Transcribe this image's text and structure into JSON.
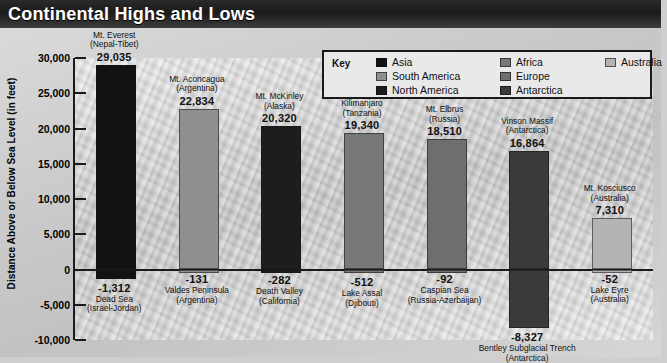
{
  "title": "Continental Highs and Lows",
  "axis": {
    "y_title": "Distance Above or Below Sea Level (in feet)",
    "ticks": [
      "30,000",
      "25,000",
      "20,000",
      "15,000",
      "10,000",
      "5,000",
      "0",
      "-5,000",
      "-10,000"
    ]
  },
  "key": {
    "label": "Key",
    "columns": [
      [
        {
          "name": "Asia",
          "color": "#121212"
        },
        {
          "name": "South America",
          "color": "#8f8f8f"
        },
        {
          "name": "North America",
          "color": "#1d1d1d"
        }
      ],
      [
        {
          "name": "Africa",
          "color": "#787878"
        },
        {
          "name": "Europe",
          "color": "#6e6e6e"
        },
        {
          "name": "Antarctica",
          "color": "#3a3a3a"
        }
      ],
      [
        {
          "name": "Australia",
          "color": "#b4b4b4"
        }
      ]
    ]
  },
  "chart_data": {
    "type": "bar",
    "title": "Continental Highs and Lows",
    "xlabel": "",
    "ylabel": "Distance Above or Below Sea Level (in feet)",
    "ylim": [
      -10000,
      30000
    ],
    "ytick_step": 5000,
    "grid": false,
    "legend_position": "top-right",
    "categories": [
      "Asia",
      "South America",
      "North America",
      "Africa",
      "Europe",
      "Antarctica",
      "Australia"
    ],
    "series": [
      {
        "name": "Highest point",
        "values": [
          29035,
          22834,
          20320,
          19340,
          18510,
          16864,
          7310
        ]
      },
      {
        "name": "Lowest point",
        "values": [
          -1312,
          -131,
          -282,
          -512,
          -92,
          -8327,
          -52
        ]
      }
    ],
    "points": [
      {
        "continent": "Asia",
        "color": "#121212",
        "high_name": "Mt. Everest",
        "high_place": "(Nepal-Tibet)",
        "high_value": 29035,
        "high_label": "29,035",
        "low_name": "Dead Sea",
        "low_place": "(Israel-Jordan)",
        "low_value": -1312,
        "low_label": "-1,312"
      },
      {
        "continent": "South America",
        "color": "#8f8f8f",
        "high_name": "Mt. Aconcagua",
        "high_place": "(Argentina)",
        "high_value": 22834,
        "high_label": "22,834",
        "low_name": "Valdes Peninsula",
        "low_place": "(Argentina)",
        "low_value": -131,
        "low_label": "-131"
      },
      {
        "continent": "North America",
        "color": "#1d1d1d",
        "high_name": "Mt. McKinley",
        "high_place": "(Alaska)",
        "high_value": 20320,
        "high_label": "20,320",
        "low_name": "Death Valley",
        "low_place": "(California)",
        "low_value": -282,
        "low_label": "-282"
      },
      {
        "continent": "Africa",
        "color": "#787878",
        "high_name": "Kilimanjaro",
        "high_place": "(Tanzania)",
        "high_value": 19340,
        "high_label": "19,340",
        "low_name": "Lake Assal",
        "low_place": "(Djibouti)",
        "low_value": -512,
        "low_label": "-512"
      },
      {
        "continent": "Europe",
        "color": "#6e6e6e",
        "high_name": "Mt. Elbrus",
        "high_place": "(Russia)",
        "high_value": 18510,
        "high_label": "18,510",
        "low_name": "Caspian Sea",
        "low_place": "(Russia-Azerbaijan)",
        "low_value": -92,
        "low_label": "-92"
      },
      {
        "continent": "Antarctica",
        "color": "#3a3a3a",
        "high_name": "Vinson Massif",
        "high_place": "(Antarctica)",
        "high_value": 16864,
        "high_label": "16,864",
        "low_name": "Bentley Subglacial Trench",
        "low_place": "(Antarctica)",
        "low_value": -8327,
        "low_label": "-8,327"
      },
      {
        "continent": "Australia",
        "color": "#b4b4b4",
        "high_name": "Mt. Kosciusco",
        "high_place": "(Australia)",
        "high_value": 7310,
        "high_label": "7,310",
        "low_name": "Lake Eyre",
        "low_place": "(Australia)",
        "low_value": -52,
        "low_label": "-52"
      }
    ]
  }
}
